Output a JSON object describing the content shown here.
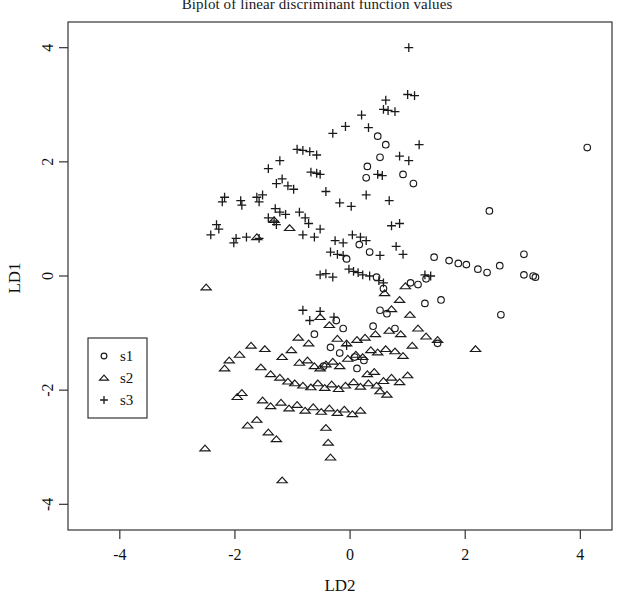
{
  "chart_data": {
    "type": "scatter",
    "title": "Biplot of linear discriminant function values",
    "xlabel": "LD2",
    "ylabel": "LD1",
    "xlim": [
      -4.9,
      4.55
    ],
    "ylim": [
      -4.45,
      4.45
    ],
    "xticks": [
      -4,
      -2,
      0,
      2,
      4
    ],
    "yticks": [
      -4,
      -2,
      0,
      2,
      4
    ],
    "xtick_labels": [
      "-4",
      "-2",
      "0",
      "2",
      "4"
    ],
    "ytick_labels": [
      "-4",
      "-2",
      "0",
      "2",
      "4"
    ],
    "grid": false,
    "legend_position": "left-lower",
    "series": [
      {
        "name": "s1",
        "marker": "circle",
        "points": [
          [
            0.48,
            2.45
          ],
          [
            0.62,
            2.3
          ],
          [
            0.52,
            2.08
          ],
          [
            0.3,
            1.92
          ],
          [
            0.28,
            1.72
          ],
          [
            0.92,
            1.78
          ],
          [
            1.1,
            1.62
          ],
          [
            2.42,
            1.14
          ],
          [
            3.02,
            0.38
          ],
          [
            2.6,
            0.18
          ],
          [
            1.46,
            0.33
          ],
          [
            1.72,
            0.27
          ],
          [
            1.88,
            0.22
          ],
          [
            2.02,
            0.2
          ],
          [
            2.22,
            0.12
          ],
          [
            2.38,
            0.06
          ],
          [
            3.02,
            0.02
          ],
          [
            3.18,
            0.0
          ],
          [
            3.22,
            -0.02
          ],
          [
            1.32,
            -0.05
          ],
          [
            1.05,
            -0.12
          ],
          [
            1.18,
            -0.15
          ],
          [
            2.62,
            -0.68
          ],
          [
            1.58,
            -0.42
          ],
          [
            1.3,
            -0.48
          ],
          [
            0.52,
            -0.6
          ],
          [
            0.64,
            -0.66
          ],
          [
            0.4,
            -0.88
          ],
          [
            0.78,
            -0.92
          ],
          [
            1.52,
            -1.18
          ],
          [
            -0.24,
            -0.78
          ],
          [
            -0.12,
            -0.92
          ],
          [
            -0.62,
            -1.02
          ],
          [
            -0.34,
            -1.25
          ],
          [
            -0.18,
            -1.35
          ],
          [
            0.08,
            -1.42
          ],
          [
            0.24,
            -1.48
          ],
          [
            -0.46,
            -1.58
          ],
          [
            0.12,
            -1.62
          ],
          [
            4.12,
            2.25
          ],
          [
            0.16,
            0.55
          ],
          [
            0.34,
            0.42
          ],
          [
            -0.06,
            0.3
          ],
          [
            0.46,
            -0.02
          ],
          [
            0.58,
            -0.22
          ]
        ]
      },
      {
        "name": "s2",
        "marker": "triangle",
        "points": [
          [
            -2.5,
            -0.2
          ],
          [
            -2.52,
            -3.02
          ],
          [
            -1.62,
            0.68
          ],
          [
            -1.32,
            0.98
          ],
          [
            -1.05,
            0.84
          ],
          [
            -0.52,
            -0.72
          ],
          [
            -0.36,
            -0.86
          ],
          [
            -1.48,
            -1.28
          ],
          [
            -1.18,
            -1.42
          ],
          [
            -1.02,
            -1.3
          ],
          [
            -0.88,
            -1.52
          ],
          [
            -0.74,
            -1.48
          ],
          [
            -0.62,
            -1.58
          ],
          [
            -0.52,
            -1.62
          ],
          [
            -0.42,
            -1.55
          ],
          [
            -0.3,
            -1.5
          ],
          [
            -0.18,
            -1.58
          ],
          [
            -0.04,
            -1.45
          ],
          [
            0.1,
            -1.38
          ],
          [
            0.22,
            -1.42
          ],
          [
            0.36,
            -1.3
          ],
          [
            0.48,
            -1.34
          ],
          [
            0.62,
            -1.28
          ],
          [
            0.78,
            -1.32
          ],
          [
            0.92,
            -1.4
          ],
          [
            1.08,
            -1.22
          ],
          [
            -1.72,
            -1.22
          ],
          [
            -1.92,
            -1.38
          ],
          [
            -1.55,
            -1.6
          ],
          [
            -1.38,
            -1.72
          ],
          [
            -1.22,
            -1.78
          ],
          [
            -1.08,
            -1.85
          ],
          [
            -0.96,
            -1.88
          ],
          [
            -0.82,
            -1.92
          ],
          [
            -0.68,
            -1.95
          ],
          [
            -0.56,
            -1.88
          ],
          [
            -0.44,
            -1.96
          ],
          [
            -0.32,
            -1.9
          ],
          [
            -0.2,
            -1.98
          ],
          [
            -0.08,
            -1.92
          ],
          [
            0.06,
            -1.86
          ],
          [
            0.18,
            -1.94
          ],
          [
            0.32,
            -1.88
          ],
          [
            0.46,
            -1.92
          ],
          [
            0.58,
            -1.84
          ],
          [
            0.72,
            -1.78
          ],
          [
            0.86,
            -1.86
          ],
          [
            1.0,
            -1.74
          ],
          [
            -1.52,
            -2.18
          ],
          [
            -1.38,
            -2.28
          ],
          [
            -1.2,
            -2.22
          ],
          [
            -1.06,
            -2.32
          ],
          [
            -0.92,
            -2.26
          ],
          [
            -0.78,
            -2.36
          ],
          [
            -0.64,
            -2.3
          ],
          [
            -0.5,
            -2.38
          ],
          [
            -0.36,
            -2.32
          ],
          [
            -0.22,
            -2.4
          ],
          [
            -0.1,
            -2.34
          ],
          [
            0.04,
            -2.42
          ],
          [
            0.18,
            -2.36
          ],
          [
            -1.62,
            -2.52
          ],
          [
            -1.78,
            -2.62
          ],
          [
            -1.42,
            -2.74
          ],
          [
            -1.28,
            -2.86
          ],
          [
            -0.42,
            -2.66
          ],
          [
            -0.38,
            -2.92
          ],
          [
            -0.34,
            -3.18
          ],
          [
            -1.18,
            -3.58
          ],
          [
            -2.1,
            -1.48
          ],
          [
            -2.18,
            -1.62
          ],
          [
            -1.88,
            -2.05
          ],
          [
            -1.96,
            -2.12
          ],
          [
            0.68,
            -0.96
          ],
          [
            0.88,
            -1.02
          ],
          [
            1.18,
            -0.92
          ],
          [
            1.32,
            -1.06
          ],
          [
            1.52,
            -1.12
          ],
          [
            2.18,
            -1.28
          ],
          [
            0.72,
            -0.58
          ],
          [
            0.86,
            -0.42
          ],
          [
            0.6,
            -0.3
          ],
          [
            1.04,
            -0.68
          ],
          [
            0.96,
            -0.18
          ],
          [
            0.44,
            -1.02
          ],
          [
            0.26,
            -1.08
          ],
          [
            0.12,
            -1.12
          ],
          [
            -0.06,
            -1.18
          ],
          [
            -0.22,
            -1.1
          ],
          [
            -0.9,
            -1.08
          ],
          [
            -0.72,
            -1.18
          ],
          [
            0.52,
            -2.02
          ],
          [
            0.64,
            -2.08
          ],
          [
            0.3,
            -1.72
          ],
          [
            0.42,
            -1.68
          ]
        ]
      },
      {
        "name": "s3",
        "marker": "plus",
        "points": [
          [
            1.02,
            4.0
          ],
          [
            1.0,
            3.18
          ],
          [
            1.12,
            3.16
          ],
          [
            0.62,
            3.08
          ],
          [
            0.58,
            2.92
          ],
          [
            0.66,
            2.9
          ],
          [
            0.78,
            2.88
          ],
          [
            0.2,
            2.82
          ],
          [
            -0.08,
            2.62
          ],
          [
            -0.3,
            2.5
          ],
          [
            0.32,
            2.6
          ],
          [
            1.2,
            2.3
          ],
          [
            -0.92,
            2.22
          ],
          [
            -0.82,
            2.2
          ],
          [
            -0.7,
            2.18
          ],
          [
            -0.58,
            2.12
          ],
          [
            -1.22,
            2.02
          ],
          [
            -1.42,
            1.88
          ],
          [
            -0.68,
            1.82
          ],
          [
            -0.58,
            1.8
          ],
          [
            -0.52,
            1.78
          ],
          [
            -1.18,
            1.7
          ],
          [
            -1.28,
            1.62
          ],
          [
            -1.08,
            1.58
          ],
          [
            -0.98,
            1.52
          ],
          [
            -1.52,
            1.42
          ],
          [
            -1.62,
            1.38
          ],
          [
            -1.58,
            1.3
          ],
          [
            -1.9,
            1.32
          ],
          [
            -1.88,
            1.24
          ],
          [
            -1.3,
            1.18
          ],
          [
            -1.22,
            1.12
          ],
          [
            -1.12,
            1.08
          ],
          [
            -1.42,
            1.02
          ],
          [
            -1.32,
            0.96
          ],
          [
            -1.28,
            0.9
          ],
          [
            -0.88,
            1.12
          ],
          [
            -0.78,
            1.02
          ],
          [
            -0.72,
            0.92
          ],
          [
            -1.8,
            0.68
          ],
          [
            -0.82,
            0.72
          ],
          [
            -0.62,
            0.68
          ],
          [
            -0.52,
            0.82
          ],
          [
            -1.58,
            0.66
          ],
          [
            -0.26,
            0.62
          ],
          [
            -0.12,
            0.58
          ],
          [
            0.04,
            0.72
          ],
          [
            0.18,
            0.68
          ],
          [
            0.28,
            0.62
          ],
          [
            -0.34,
            0.42
          ],
          [
            -0.22,
            0.38
          ],
          [
            -0.12,
            0.36
          ],
          [
            0.8,
            0.52
          ],
          [
            0.92,
            0.38
          ],
          [
            0.52,
            0.36
          ],
          [
            -0.02,
            0.12
          ],
          [
            0.06,
            0.08
          ],
          [
            0.14,
            0.06
          ],
          [
            0.22,
            0.02
          ],
          [
            0.34,
            0.0
          ],
          [
            1.3,
            0.02
          ],
          [
            1.4,
            0.0
          ],
          [
            -0.42,
            0.04
          ],
          [
            -0.52,
            0.02
          ],
          [
            -0.3,
            -0.02
          ],
          [
            0.5,
            -0.08
          ],
          [
            0.58,
            -0.12
          ],
          [
            -0.52,
            -0.62
          ],
          [
            -0.28,
            -0.72
          ],
          [
            -0.7,
            -0.78
          ],
          [
            -0.82,
            -0.6
          ],
          [
            1.02,
            2.02
          ],
          [
            0.86,
            2.1
          ],
          [
            0.48,
            1.78
          ],
          [
            0.56,
            1.76
          ],
          [
            -2.18,
            1.38
          ],
          [
            -2.22,
            1.3
          ],
          [
            -2.32,
            0.9
          ],
          [
            -2.28,
            0.82
          ],
          [
            -2.42,
            0.72
          ],
          [
            -1.98,
            0.66
          ],
          [
            -2.02,
            0.58
          ],
          [
            0.86,
            0.92
          ],
          [
            0.72,
            0.88
          ],
          [
            -0.18,
            1.28
          ],
          [
            0.02,
            1.22
          ],
          [
            0.68,
            1.32
          ],
          [
            0.28,
            1.42
          ],
          [
            -0.42,
            1.48
          ],
          [
            -0.06,
            -1.22
          ]
        ]
      }
    ]
  },
  "legend": {
    "entries": [
      {
        "label": "s1",
        "marker": "circle-icon"
      },
      {
        "label": "s2",
        "marker": "triangle-icon"
      },
      {
        "label": "s3",
        "marker": "plus-icon"
      }
    ]
  }
}
